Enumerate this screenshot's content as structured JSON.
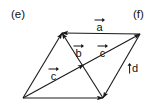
{
  "figure": {
    "type": "vector-parallelogram-diagram",
    "background_color": "#ffffff",
    "stroke_color": "#1a1a1a",
    "text_color": "#111111",
    "width": 155,
    "height": 111,
    "panel_labels": [
      {
        "id": "e",
        "text": "(e)",
        "x": 11,
        "y": 9
      },
      {
        "id": "f",
        "text": "(f)",
        "x": 133,
        "y": 9
      }
    ],
    "vertices": {
      "top_left": {
        "x": 62,
        "y": 33
      },
      "top_right": {
        "x": 140,
        "y": 34
      },
      "bottom_right": {
        "x": 103,
        "y": 98
      },
      "bottom_left": {
        "x": 23,
        "y": 98
      }
    },
    "vector_labels": [
      {
        "id": "a",
        "letter": "a",
        "x": 94,
        "y": 17,
        "orientation": "horizontal"
      },
      {
        "id": "b",
        "letter": "b",
        "x": 73,
        "y": 43,
        "orientation": "horizontal"
      },
      {
        "id": "c-upper",
        "letter": "c",
        "x": 97,
        "y": 43,
        "orientation": "horizontal"
      },
      {
        "id": "c-lower",
        "letter": "c",
        "x": 48,
        "y": 66,
        "orientation": "horizontal"
      },
      {
        "id": "d",
        "letter": "d",
        "x": 127,
        "y": 63,
        "orientation": "vertical"
      }
    ],
    "segments": [
      {
        "name": "top-edge-vector-a",
        "from": "top_right",
        "to": "top_left",
        "arrow": "end",
        "label": "a"
      },
      {
        "name": "right-edge-vector-d",
        "from": "top_right",
        "to": "bottom_right",
        "arrow": "end",
        "label": "d"
      },
      {
        "name": "bottom-edge",
        "from": "bottom_left",
        "to": "bottom_right",
        "arrow": "end",
        "label": ""
      },
      {
        "name": "left-edge",
        "from": "bottom_left",
        "to": "top_left",
        "arrow": "end",
        "label": ""
      },
      {
        "name": "diagonal-vector-b",
        "from": "bottom_right",
        "to": "top_left",
        "arrow": "end",
        "label": "b"
      },
      {
        "name": "diagonal-vector-c",
        "from": "bottom_left",
        "to": "top_right",
        "arrow": "mid-and-end",
        "label": "c"
      }
    ]
  }
}
